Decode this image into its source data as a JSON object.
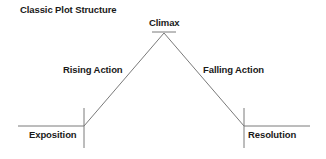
{
  "title": "Classic Plot Structure",
  "stages": {
    "exposition": "Exposition",
    "rising_action": "Rising Action",
    "climax": "Climax",
    "falling_action": "Falling Action",
    "resolution": "Resolution"
  },
  "colors": {
    "line": "#7a7a7a",
    "text": "#1a1a1a",
    "background": "#ffffff"
  }
}
